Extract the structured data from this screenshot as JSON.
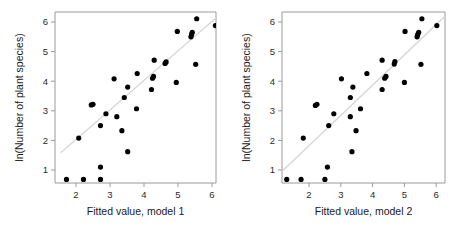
{
  "figure": {
    "background_color": "#ffffff",
    "dot_color": "#000000",
    "line_color": "#d8d8d8",
    "frame_color": "#9a9a9a"
  },
  "chart_data": [
    {
      "type": "scatter",
      "panel_id": "left",
      "title": "",
      "xlabel": "Fitted value, model 1",
      "ylabel": "ln(Number of plant species)",
      "xlim": [
        1.55,
        6.3
      ],
      "ylim": [
        0.45,
        6.35
      ],
      "xticks": [
        2,
        3,
        4,
        5,
        6
      ],
      "yticks": [
        1,
        2,
        3,
        4,
        5,
        6
      ],
      "xtick_labels": [
        "2",
        "3",
        "4",
        "5",
        "6"
      ],
      "ytick_labels": [
        "1",
        "2",
        "3",
        "4",
        "5",
        "6"
      ],
      "grid": false,
      "legend": null,
      "x": [
        1.72,
        2.22,
        2.72,
        2.08,
        2.72,
        2.45,
        2.5,
        2.72,
        2.88,
        3.2,
        3.12,
        3.35,
        3.42,
        3.52,
        3.52,
        3.78,
        3.8,
        4.22,
        4.25,
        4.28,
        4.3,
        4.62,
        4.65,
        4.95,
        4.98,
        5.38,
        5.4,
        5.42,
        5.52,
        5.55,
        6.1
      ],
      "y": [
        0.68,
        0.68,
        0.68,
        2.08,
        1.1,
        3.2,
        3.22,
        2.5,
        2.9,
        2.8,
        4.08,
        2.33,
        3.45,
        1.62,
        3.8,
        3.07,
        4.26,
        3.72,
        4.1,
        4.16,
        4.71,
        4.6,
        4.65,
        3.96,
        5.68,
        5.5,
        5.58,
        5.65,
        4.57,
        6.11,
        5.88
      ],
      "fit_line": {
        "x0": 1.55,
        "y0": 1.58,
        "x1": 6.3,
        "y1": 6.32
      },
      "n_points": 31
    },
    {
      "type": "scatter",
      "panel_id": "right",
      "title": "",
      "xlabel": "Fitted value, model 2",
      "ylabel": "ln(Number of plant species)",
      "xlim": [
        1.18,
        6.28
      ],
      "ylim": [
        0.45,
        6.35
      ],
      "xticks": [
        2,
        3,
        4,
        5,
        6
      ],
      "yticks": [
        1,
        2,
        3,
        4,
        5,
        6
      ],
      "xtick_labels": [
        "2",
        "3",
        "4",
        "5",
        "6"
      ],
      "ytick_labels": [
        "1",
        "2",
        "3",
        "4",
        "5",
        "6"
      ],
      "grid": false,
      "legend": null,
      "x": [
        1.3,
        1.75,
        2.5,
        1.82,
        2.58,
        2.2,
        2.25,
        2.62,
        2.78,
        3.3,
        3.02,
        3.48,
        3.3,
        3.35,
        3.38,
        3.62,
        3.82,
        4.3,
        4.38,
        4.42,
        4.3,
        4.68,
        4.7,
        5.0,
        5.02,
        5.4,
        5.42,
        5.45,
        5.52,
        5.55,
        6.02
      ],
      "y": [
        0.68,
        0.68,
        0.68,
        2.08,
        1.1,
        3.18,
        3.22,
        2.5,
        2.9,
        2.8,
        4.08,
        2.33,
        3.45,
        1.62,
        3.8,
        3.07,
        4.26,
        3.72,
        4.1,
        4.16,
        4.71,
        4.58,
        4.66,
        3.96,
        5.68,
        5.5,
        5.58,
        5.65,
        4.57,
        6.11,
        5.88
      ],
      "fit_line": {
        "x0": 1.18,
        "y0": 0.98,
        "x1": 6.28,
        "y1": 6.2
      },
      "n_points": 31
    }
  ]
}
